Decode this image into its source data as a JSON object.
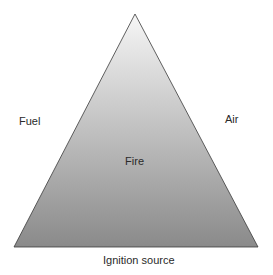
{
  "diagram": {
    "type": "fire-triangle",
    "center_label": "Fire",
    "sides": {
      "left": "Fuel",
      "right": "Air",
      "bottom": "Ignition source"
    },
    "colors": {
      "gradient_top": "#f6f6f6",
      "gradient_bottom": "#8a8a8a",
      "outline": "#3a3a3a",
      "text": "#2a2a2a"
    }
  }
}
